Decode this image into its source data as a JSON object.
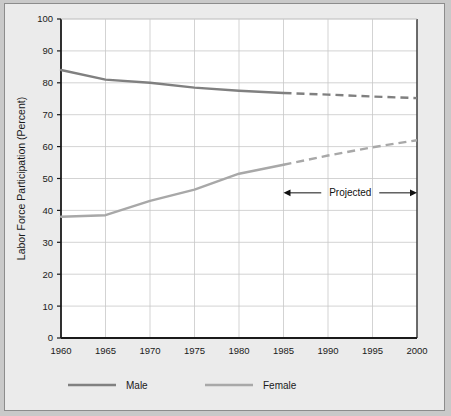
{
  "chart_data": {
    "type": "line",
    "title": "",
    "xlabel": "",
    "ylabel": "Labor Force Participation (Percent)",
    "xlim": [
      1960,
      2000
    ],
    "ylim": [
      0,
      100
    ],
    "grid": true,
    "legend_position": "bottom",
    "x": [
      1960,
      1965,
      1970,
      1975,
      1980,
      1985,
      1990,
      1995,
      2000
    ],
    "xtick_labels": [
      "1960",
      "1965",
      "1970",
      "1975",
      "1980",
      "1985",
      "1990",
      "1995",
      "2000"
    ],
    "ytick_labels": [
      "0",
      "10",
      "20",
      "30",
      "40",
      "50",
      "60",
      "70",
      "80",
      "90",
      "100"
    ],
    "ytick_values": [
      0,
      10,
      20,
      30,
      40,
      50,
      60,
      70,
      80,
      90,
      100
    ],
    "projection_start_year": 1985,
    "series": [
      {
        "name": "Male",
        "color": "#808080",
        "values": [
          84,
          81,
          80,
          78.5,
          77.5,
          76.8,
          76.3,
          75.7,
          75.2
        ],
        "actual_values": [
          84,
          81,
          80,
          78.5,
          77.5,
          76.8
        ],
        "projected_values": [
          76.8,
          76.3,
          75.7,
          75.2
        ]
      },
      {
        "name": "Female",
        "color": "#a8a8a8",
        "values": [
          38,
          38.5,
          43,
          46.5,
          51.5,
          54.3,
          57.2,
          59.8,
          62
        ],
        "actual_values": [
          38,
          38.5,
          43,
          46.5,
          51.5,
          54.3
        ],
        "projected_values": [
          54.3,
          57.2,
          59.8,
          62
        ]
      }
    ],
    "annotations": [
      {
        "text": "Projected",
        "type": "double-arrow",
        "x_start": 1985,
        "x_end": 2000,
        "y": 45.5
      }
    ]
  },
  "legend": {
    "items": [
      {
        "label": "Male",
        "color": "#808080",
        "style": "solid"
      },
      {
        "label": "Female",
        "color": "#a8a8a8",
        "style": "solid"
      }
    ]
  },
  "axes": {
    "y_title": "Labor Force Participation (Percent)"
  },
  "colors": {
    "figure_background": "#ebebeb",
    "plot_background": "#ffffff",
    "frame_border": "#8c8c8c",
    "axis": "#1a1a1a",
    "grid": "#c8c8c8",
    "male_series": "#808080",
    "female_series": "#a8a8a8",
    "annotation": "#111111"
  }
}
